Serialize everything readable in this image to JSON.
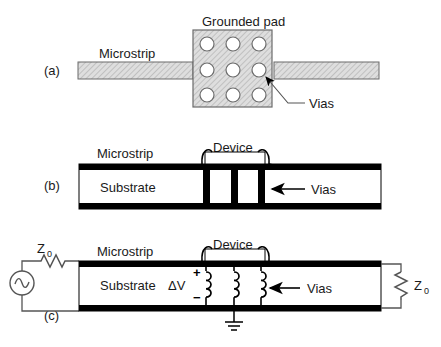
{
  "figure": {
    "title_visible": false,
    "background_color": "#ffffff",
    "ink_color": "#1a1a1a",
    "hatch_fill_color": "#d8d8d8",
    "metal_color": "#000000"
  },
  "panel_a": {
    "tag": "(a)",
    "labels": {
      "grounded_pad": "Grounded pad",
      "microstrip": "Microstrip",
      "vias": "Vias"
    },
    "via_count": 9,
    "via_grid_rows": 3,
    "via_grid_cols": 3
  },
  "panel_b": {
    "tag": "(b)",
    "labels": {
      "microstrip": "Microstrip",
      "device": "Device",
      "substrate": "Substrate",
      "vias": "Vias"
    },
    "via_count": 3
  },
  "panel_c": {
    "tag": "(c)",
    "labels": {
      "microstrip": "Microstrip",
      "device": "Device",
      "substrate": "Substrate",
      "vias": "Vias",
      "delta_v": "ΔV",
      "plus_sign": "+",
      "minus_sign": "−",
      "z_source": "Z",
      "z_source_sub": "0",
      "z_load": "Z",
      "z_load_sub": "0"
    },
    "inductor_count": 3,
    "resistor_count": 2,
    "source_type": "ac-sine"
  }
}
